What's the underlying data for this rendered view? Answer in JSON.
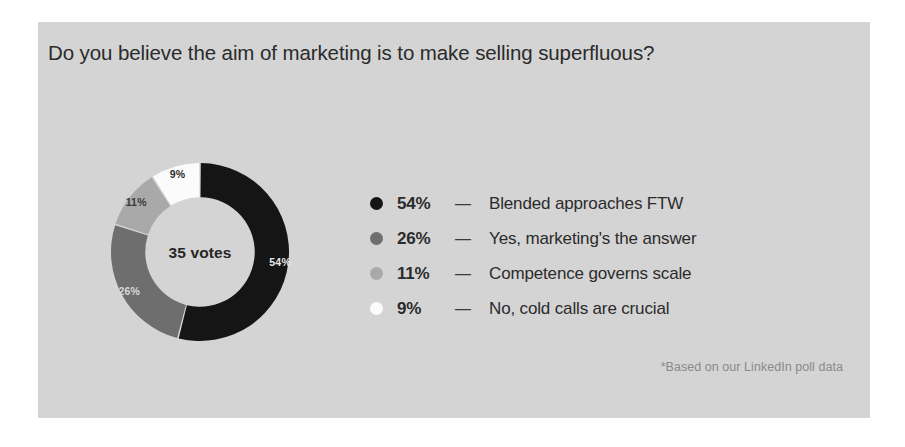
{
  "card": {
    "background_color": "#d4d4d4",
    "page_background_color": "#ffffff"
  },
  "title": "Do you believe the aim of marketing is to make selling superfluous?",
  "center_label": "35 votes",
  "footnote": "*Based on our LinkedIn poll data",
  "legend": {
    "dash": "—",
    "items": [
      {
        "pct": "54%",
        "label": "Blended approaches FTW",
        "color": "#151515"
      },
      {
        "pct": "26%",
        "label": "Yes, marketing's the answer",
        "color": "#6e6e6e"
      },
      {
        "pct": "11%",
        "label": "Competence governs scale",
        "color": "#a9a9a9"
      },
      {
        "pct": "9%",
        "label": "No, cold calls are crucial",
        "color": "#fbfbfb"
      }
    ]
  },
  "chart_data": {
    "type": "pie",
    "title": "Do you believe the aim of marketing is to make selling superfluous?",
    "subtitle": "*Based on our LinkedIn poll data",
    "center_text": "35 votes",
    "total_votes": 35,
    "donut": true,
    "inner_radius_ratio": 0.615,
    "start_angle_deg": 0,
    "direction": "clockwise",
    "legend_position": "right",
    "grid": false,
    "categories": [
      "Blended approaches FTW",
      "Yes, marketing's the answer",
      "Competence governs scale",
      "No, cold calls are crucial"
    ],
    "values": [
      54,
      26,
      11,
      9
    ],
    "value_labels": [
      "54%",
      "26%",
      "11%",
      "9%"
    ],
    "colors": [
      "#151515",
      "#6e6e6e",
      "#a9a9a9",
      "#fbfbfb"
    ],
    "label_text_colors": [
      "#e8e8e8",
      "#d8d8d8",
      "#3a3a3a",
      "#2b2b2b"
    ]
  }
}
